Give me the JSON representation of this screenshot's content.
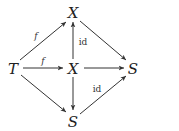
{
  "diagram": {
    "type": "commutative-diagram",
    "nodes": [
      {
        "id": "X_top",
        "label": "X",
        "x": 73,
        "y": 12
      },
      {
        "id": "T",
        "label": "T",
        "x": 13,
        "y": 68
      },
      {
        "id": "X_mid",
        "label": "X",
        "x": 73,
        "y": 68
      },
      {
        "id": "S_right",
        "label": "S",
        "x": 133,
        "y": 68
      },
      {
        "id": "S_bottom",
        "label": "S",
        "x": 73,
        "y": 121
      }
    ],
    "edges": [
      {
        "from": "T",
        "to": "X_top",
        "label": "f"
      },
      {
        "from": "T",
        "to": "X_mid",
        "label": "f"
      },
      {
        "from": "T",
        "to": "S_bottom",
        "label": ""
      },
      {
        "from": "X_mid",
        "to": "X_top",
        "label": "id"
      },
      {
        "from": "X_mid",
        "to": "S_right",
        "label": ""
      },
      {
        "from": "X_mid",
        "to": "S_bottom",
        "label": ""
      },
      {
        "from": "X_top",
        "to": "S_right",
        "label": ""
      },
      {
        "from": "S_bottom",
        "to": "S_right",
        "label": "id"
      }
    ]
  },
  "labels": {
    "node_x_top": "X",
    "node_t": "T",
    "node_x_mid": "X",
    "node_s_right": "S",
    "node_s_bottom": "S",
    "edge_t_xtop": "f",
    "edge_t_xmid": "f",
    "edge_xmid_xtop": "id",
    "edge_sbottom_sright": "id"
  }
}
